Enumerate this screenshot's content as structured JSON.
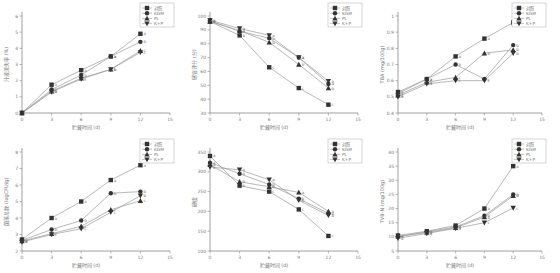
{
  "legend": [
    "对照",
    "KGM",
    "PL",
    "K+P"
  ],
  "chart_data": [
    {
      "type": "line",
      "title": "",
      "xlabel": "贮藏时间 (d)",
      "ylabel": "汁液流失率 (%)",
      "x": [
        0,
        3,
        6,
        9,
        12
      ],
      "xlim": [
        0,
        15
      ],
      "xticks": [
        0,
        3,
        6,
        9,
        12,
        15
      ],
      "ylim": [
        0,
        6
      ],
      "yticks": [
        0,
        1,
        2,
        3,
        4,
        5,
        6
      ],
      "series": [
        {
          "name": "对照",
          "values": [
            0,
            1.75,
            2.65,
            3.5,
            4.9
          ],
          "labels": [
            "",
            "a",
            "a",
            "a",
            "a"
          ]
        },
        {
          "name": "KGM",
          "values": [
            0,
            1.45,
            2.35,
            3.5,
            4.4
          ],
          "labels": [
            "",
            "b",
            "b",
            "a",
            "b"
          ]
        },
        {
          "name": "PL",
          "values": [
            0,
            1.35,
            2.15,
            2.7,
            3.85
          ],
          "labels": [
            "",
            "b",
            "c",
            "b",
            "c"
          ]
        },
        {
          "name": "K+P",
          "values": [
            0,
            1.3,
            2.1,
            2.7,
            3.75
          ],
          "labels": [
            "",
            "b",
            "c",
            "b",
            "c"
          ]
        }
      ],
      "legend_position": "upper right",
      "grid": false
    },
    {
      "type": "line",
      "title": "",
      "xlabel": "贮藏时间 (d)",
      "ylabel": "感官评分 (分)",
      "x": [
        0,
        3,
        6,
        9,
        12
      ],
      "xlim": [
        0,
        15
      ],
      "xticks": [
        0,
        3,
        6,
        9,
        12,
        15
      ],
      "ylim": [
        30,
        100
      ],
      "yticks": [
        30,
        40,
        50,
        60,
        70,
        80,
        90,
        100
      ],
      "series": [
        {
          "name": "对照",
          "values": [
            96,
            86,
            63,
            48,
            36
          ],
          "labels": [
            "a",
            "b",
            "c",
            "c",
            "c"
          ]
        },
        {
          "name": "KGM",
          "values": [
            96.5,
            89,
            84,
            70,
            51
          ],
          "labels": [
            "a",
            "a",
            "a",
            "a",
            "a"
          ]
        },
        {
          "name": "PL",
          "values": [
            96,
            89.5,
            81,
            65,
            48
          ],
          "labels": [
            "a",
            "a",
            "b",
            "b",
            "b"
          ]
        },
        {
          "name": "K+P",
          "values": [
            97,
            91,
            86,
            70,
            53
          ],
          "labels": [
            "a",
            "a",
            "a",
            "a",
            "a"
          ]
        }
      ],
      "legend_position": "upper right",
      "grid": false
    },
    {
      "type": "line",
      "title": "",
      "xlabel": "贮藏时间 (d)",
      "ylabel": "TBA (mg/100g)",
      "x": [
        0,
        3,
        6,
        9,
        12
      ],
      "xlim": [
        0,
        15
      ],
      "xticks": [
        0,
        3,
        6,
        9,
        12,
        15
      ],
      "ylim": [
        0.4,
        1.0
      ],
      "yticks": [
        0.4,
        0.5,
        0.6,
        0.7,
        0.8,
        0.9,
        1.0
      ],
      "series": [
        {
          "name": "对照",
          "values": [
            0.53,
            0.61,
            0.75,
            0.86,
            0.96
          ],
          "labels": [
            "a",
            "a",
            "a",
            "a",
            "a"
          ]
        },
        {
          "name": "KGM",
          "values": [
            0.52,
            0.61,
            0.7,
            0.61,
            0.82
          ],
          "labels": [
            "a",
            "a",
            "b",
            "c",
            "b"
          ]
        },
        {
          "name": "PL",
          "values": [
            0.51,
            0.59,
            0.62,
            0.77,
            0.79
          ],
          "labels": [
            "a",
            "a",
            "c",
            "b",
            "b"
          ]
        },
        {
          "name": "K+P",
          "values": [
            0.5,
            0.58,
            0.6,
            0.6,
            0.77
          ],
          "labels": [
            "a",
            "a",
            "c",
            "c",
            "b"
          ]
        }
      ],
      "legend_position": "upper right",
      "grid": false
    },
    {
      "type": "line",
      "title": "",
      "xlabel": "贮藏时间 (d)",
      "ylabel": "菌落总数 (logCFU/g)",
      "x": [
        0,
        3,
        6,
        9,
        12
      ],
      "xlim": [
        0,
        15
      ],
      "xticks": [
        0,
        3,
        6,
        9,
        12,
        15
      ],
      "ylim": [
        2,
        8
      ],
      "yticks": [
        2,
        3,
        4,
        5,
        6,
        7,
        8
      ],
      "series": [
        {
          "name": "对照",
          "values": [
            2.7,
            4.0,
            5.0,
            6.3,
            7.2
          ],
          "labels": [
            "a",
            "a",
            "a",
            "a",
            "a"
          ]
        },
        {
          "name": "KGM",
          "values": [
            2.65,
            3.3,
            3.85,
            5.5,
            5.6
          ],
          "labels": [
            "a",
            "b",
            "b",
            "b",
            "b"
          ]
        },
        {
          "name": "PL",
          "values": [
            2.6,
            3.05,
            3.5,
            4.5,
            5.05
          ],
          "labels": [
            "a",
            "c",
            "c",
            "c",
            "c"
          ]
        },
        {
          "name": "K+P",
          "values": [
            2.55,
            3.0,
            3.35,
            4.35,
            5.35
          ],
          "labels": [
            "a",
            "c",
            "c",
            "c",
            "b"
          ]
        }
      ],
      "legend_position": "upper right",
      "grid": false
    },
    {
      "type": "line",
      "title": "",
      "xlabel": "贮藏时间 (d)",
      "ylabel": "硬度",
      "x": [
        0,
        3,
        6,
        9,
        12
      ],
      "xlim": [
        0,
        15
      ],
      "xticks": [
        0,
        3,
        6,
        9,
        12,
        15
      ],
      "ylim": [
        100,
        350
      ],
      "yticks": [
        100,
        150,
        200,
        250,
        300,
        350
      ],
      "series": [
        {
          "name": "对照",
          "values": [
            340,
            265,
            250,
            205,
            138
          ],
          "labels": [
            "a",
            "b",
            "c",
            "c",
            "c"
          ]
        },
        {
          "name": "KGM",
          "values": [
            323,
            295,
            268,
            232,
            195
          ],
          "labels": [
            "a",
            "a",
            "b",
            "b",
            "b"
          ]
        },
        {
          "name": "PL",
          "values": [
            318,
            275,
            262,
            248,
            200
          ],
          "labels": [
            "a",
            "b",
            "b",
            "a",
            "a"
          ]
        },
        {
          "name": "K+P",
          "values": [
            312,
            305,
            280,
            228,
            190
          ],
          "labels": [
            "a",
            "a",
            "a",
            "b",
            "b"
          ]
        }
      ],
      "legend_position": "upper right",
      "grid": false
    },
    {
      "type": "line",
      "title": "",
      "xlabel": "贮藏时间 (d)",
      "ylabel": "TVB-N (mg/100g)",
      "x": [
        0,
        3,
        6,
        9,
        12
      ],
      "xlim": [
        0,
        15
      ],
      "xticks": [
        0,
        3,
        6,
        9,
        12,
        15
      ],
      "ylim": [
        5,
        40
      ],
      "yticks": [
        5,
        10,
        15,
        20,
        25,
        30,
        35,
        40
      ],
      "series": [
        {
          "name": "对照",
          "values": [
            10.5,
            12.0,
            14.0,
            20.0,
            35.0
          ],
          "labels": [
            "a",
            "a",
            "a",
            "a",
            "a"
          ]
        },
        {
          "name": "KGM",
          "values": [
            10.0,
            11.8,
            13.5,
            17.5,
            25.0
          ],
          "labels": [
            "a",
            "a",
            "a",
            "b",
            "b"
          ]
        },
        {
          "name": "PL",
          "values": [
            10.2,
            11.5,
            13.2,
            17.0,
            24.5
          ],
          "labels": [
            "a",
            "a",
            "a",
            "b",
            "b"
          ]
        },
        {
          "name": "K+P",
          "values": [
            9.5,
            11.2,
            13.0,
            15.0,
            20.2
          ],
          "labels": [
            "a",
            "a",
            "a",
            "c",
            "c"
          ]
        }
      ],
      "legend_position": "upper right",
      "grid": false
    }
  ]
}
